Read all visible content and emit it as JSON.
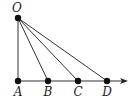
{
  "diagram": {
    "type": "geometry",
    "apex": {
      "label": "O",
      "x": 18,
      "y": 18,
      "label_x": 17,
      "label_y": 2
    },
    "baseline": {
      "y": 81,
      "x_start": 18,
      "x_end": 127,
      "arrow": true
    },
    "points": [
      {
        "label": "A",
        "x": 18,
        "label_y": 86
      },
      {
        "label": "B",
        "x": 48,
        "label_y": 86
      },
      {
        "label": "C",
        "x": 78,
        "label_y": 86
      },
      {
        "label": "D",
        "x": 107,
        "label_y": 86
      }
    ],
    "segments": [
      "OA",
      "OB",
      "OC",
      "OD"
    ],
    "colors": {
      "stroke": "#333333",
      "point": "#111111",
      "label": "#222222"
    }
  }
}
